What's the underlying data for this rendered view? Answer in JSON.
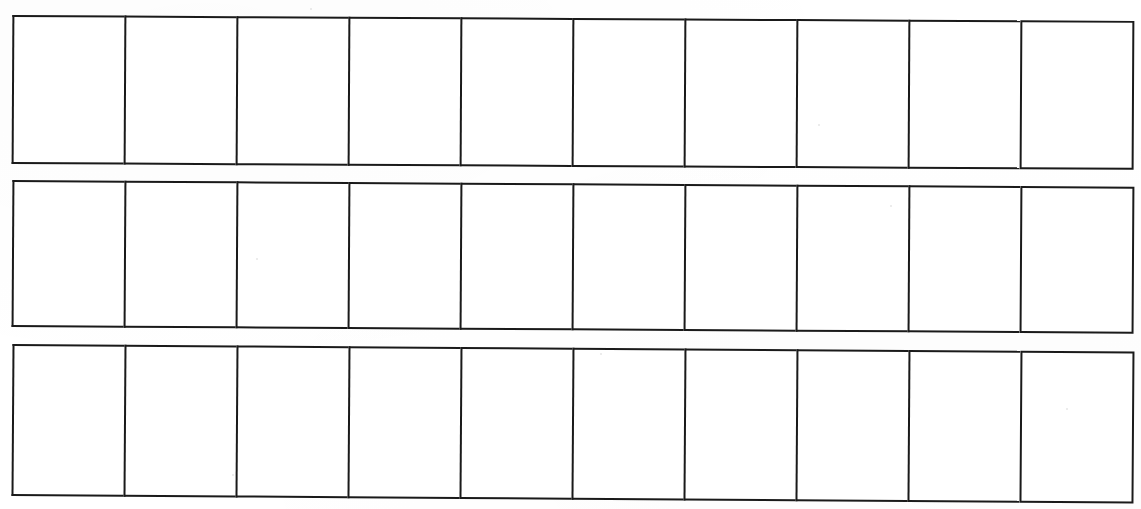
{
  "document": {
    "title": "Blank Grid Worksheet",
    "type": "scanned-blank-table",
    "description": "Scanned sheet of paper containing three separate horizontal strips, each divided into ten empty rectangular boxes.",
    "page_background_color": "#ffffff",
    "ink_color": "#1a1a1a",
    "border_width_px": 2.6,
    "canvas": {
      "width": 1141,
      "height": 509
    }
  },
  "grid": {
    "row_count": 3,
    "columns_per_row": 10,
    "rows": [
      {
        "id": "row-0",
        "label": "Row 1",
        "top": 15,
        "left": 12,
        "width": 1122,
        "height": 149,
        "cells": [
          {
            "label": "R1C1",
            "value": ""
          },
          {
            "label": "R1C2",
            "value": ""
          },
          {
            "label": "R1C3",
            "value": ""
          },
          {
            "label": "R1C4",
            "value": ""
          },
          {
            "label": "R1C5",
            "value": ""
          },
          {
            "label": "R1C6",
            "value": ""
          },
          {
            "label": "R1C7",
            "value": ""
          },
          {
            "label": "R1C8",
            "value": ""
          },
          {
            "label": "R1C9",
            "value": ""
          },
          {
            "label": "R1C10",
            "value": ""
          }
        ]
      },
      {
        "id": "row-1",
        "label": "Row 2",
        "top": 180,
        "left": 12,
        "width": 1122,
        "height": 147,
        "cells": [
          {
            "label": "R2C1",
            "value": ""
          },
          {
            "label": "R2C2",
            "value": ""
          },
          {
            "label": "R2C3",
            "value": ""
          },
          {
            "label": "R2C4",
            "value": ""
          },
          {
            "label": "R2C5",
            "value": ""
          },
          {
            "label": "R2C6",
            "value": ""
          },
          {
            "label": "R2C7",
            "value": ""
          },
          {
            "label": "R2C8",
            "value": ""
          },
          {
            "label": "R2C9",
            "value": ""
          },
          {
            "label": "R2C10",
            "value": ""
          }
        ]
      },
      {
        "id": "row-2",
        "label": "Row 3",
        "top": 344,
        "left": 12,
        "width": 1122,
        "height": 152,
        "cells": [
          {
            "label": "R3C1",
            "value": ""
          },
          {
            "label": "R3C2",
            "value": ""
          },
          {
            "label": "R3C3",
            "value": ""
          },
          {
            "label": "R3C4",
            "value": ""
          },
          {
            "label": "R3C5",
            "value": ""
          },
          {
            "label": "R3C6",
            "value": ""
          },
          {
            "label": "R3C7",
            "value": ""
          },
          {
            "label": "R3C8",
            "value": ""
          },
          {
            "label": "R3C9",
            "value": ""
          },
          {
            "label": "R3C10",
            "value": ""
          }
        ]
      }
    ]
  },
  "artifacts": {
    "specks": [
      {
        "x": 310,
        "y": 8,
        "size": 2
      },
      {
        "x": 818,
        "y": 124,
        "size": 2
      },
      {
        "x": 256,
        "y": 258,
        "size": 2
      },
      {
        "x": 232,
        "y": 474,
        "size": 2
      },
      {
        "x": 1066,
        "y": 408,
        "size": 2
      },
      {
        "x": 600,
        "y": 353,
        "size": 2
      },
      {
        "x": 890,
        "y": 205,
        "size": 2
      }
    ]
  }
}
